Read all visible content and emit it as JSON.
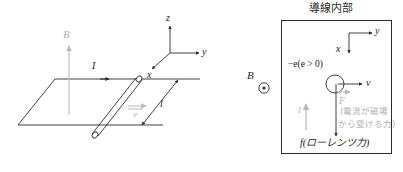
{
  "figure": {
    "title_right_box": "導線内部",
    "width": 403,
    "height": 172,
    "colors": {
      "stroke": "#2b2b2b",
      "gray": "#b0b0b0",
      "background": "#ffffff"
    }
  },
  "left_diagram": {
    "name": "rod-on-rails-3d",
    "axes": {
      "z_label": "z",
      "y_label": "y",
      "x_label": "x"
    },
    "labels": {
      "magnetic_field": "B",
      "current": "I",
      "length": "l",
      "velocity": "v"
    }
  },
  "right_diagram": {
    "name": "inside-conductor-box",
    "title": "導線内部",
    "axes": {
      "y_label": "y",
      "x_label": "x"
    },
    "labels": {
      "field_out_of_page": "B",
      "field_symbol": "circle-dot-icon",
      "charge": "−e(e > 0)",
      "velocity": "v",
      "force_on_current": "F",
      "current": "I",
      "force_note": "(電流が磁場から受ける力)",
      "force_note_line1": "(電流が磁場",
      "force_note_line2": "から受ける力)",
      "lorentz_force": "f(ローレンツ力)"
    }
  }
}
